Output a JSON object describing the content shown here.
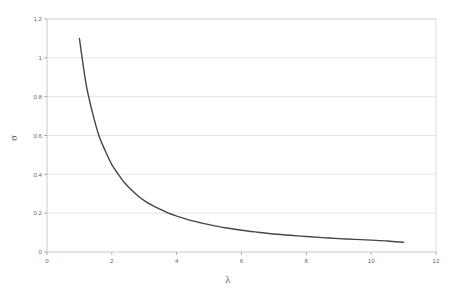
{
  "chart_data": {
    "type": "line",
    "title": "",
    "xlabel": "λ",
    "ylabel": "σ",
    "xlim": [
      0,
      12
    ],
    "ylim": [
      0,
      1.2
    ],
    "grid": "horizontal",
    "legend": "none",
    "xticks": [
      "0",
      "2",
      "4",
      "6",
      "8",
      "10",
      "12"
    ],
    "xtick_values": [
      0,
      2,
      4,
      6,
      8,
      10,
      12
    ],
    "yticks": [
      "0",
      "0.2",
      "0.4",
      "0.6",
      "0.8",
      "1",
      "1.2"
    ],
    "ytick_values": [
      0,
      0.2,
      0.4,
      0.6,
      0.8,
      1,
      1.2
    ],
    "series": [
      {
        "name": "sigma-vs-lambda",
        "color": "#464646",
        "x": [
          1.0,
          1.2,
          1.4,
          1.6,
          1.8,
          2.0,
          2.2,
          2.4,
          2.6,
          2.8,
          3.0,
          3.25,
          3.5,
          3.75,
          4.0,
          4.25,
          4.5,
          4.75,
          5.0,
          5.5,
          6.0,
          6.5,
          7.0,
          7.5,
          8.0,
          8.5,
          9.0,
          9.5,
          10.0,
          10.5,
          11.0
        ],
        "y": [
          1.1,
          0.87,
          0.72,
          0.6,
          0.52,
          0.45,
          0.4,
          0.355,
          0.32,
          0.29,
          0.265,
          0.24,
          0.22,
          0.2,
          0.185,
          0.172,
          0.16,
          0.15,
          0.141,
          0.125,
          0.112,
          0.102,
          0.093,
          0.086,
          0.08,
          0.074,
          0.069,
          0.065,
          0.061,
          0.057,
          0.05
        ]
      }
    ]
  },
  "axis_titles": {
    "x": "λ",
    "y": "σ"
  },
  "colors": {
    "curve": "#464646",
    "gridline": "#d9d9d9",
    "axis": "#bdbdbd",
    "tick_label": "#6b6b6b",
    "background": "#ffffff"
  }
}
